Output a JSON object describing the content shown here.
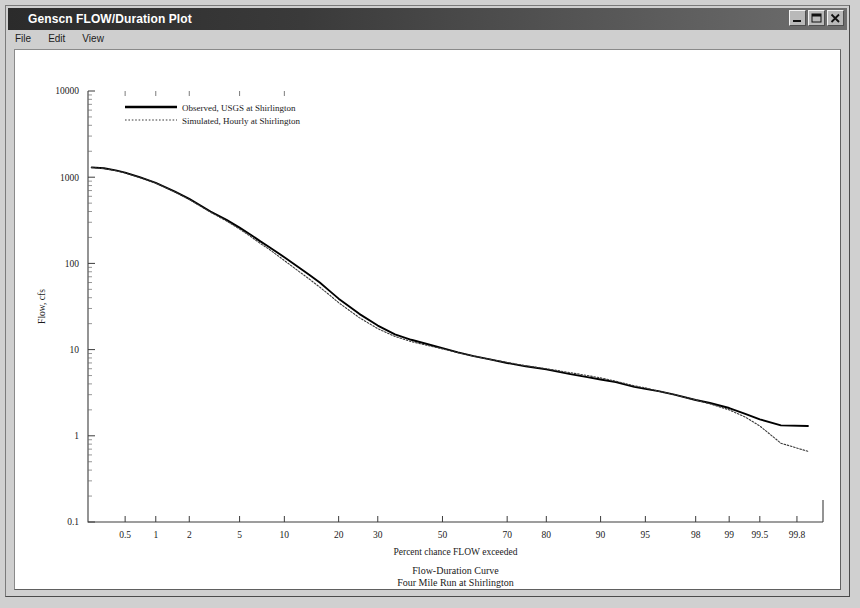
{
  "window": {
    "title": "Genscn FLOW/Duration Plot",
    "buttons": [
      {
        "name": "minimize-button",
        "glyph": "minimize"
      },
      {
        "name": "maximize-button",
        "glyph": "maximize"
      },
      {
        "name": "close-button",
        "glyph": "close"
      }
    ]
  },
  "menu": {
    "items": [
      {
        "label": "File",
        "accel": "F"
      },
      {
        "label": "Edit",
        "accel": "E"
      },
      {
        "label": "View",
        "accel": "V"
      }
    ]
  },
  "chart_data": {
    "type": "line",
    "title": "Flow-Duration Curve",
    "subtitle": "Four Mile Run at Shirlington",
    "daterange": "Jan 1, 1999 - May 31, 2001",
    "xlabel": "Percent chance FLOW exceeded",
    "ylabel": "Flow, cfs",
    "xscale": "probability",
    "yscale": "log",
    "ylim": [
      0.1,
      10000
    ],
    "xlim": [
      0.2,
      99.9
    ],
    "grid": false,
    "legend_position": "top-left",
    "ytick_labels": [
      "10000",
      "1000",
      "100",
      "10",
      "1",
      "0.1"
    ],
    "ytick_values": [
      10000,
      1000,
      100,
      10,
      1,
      0.1
    ],
    "xtick_labels": [
      "0.5",
      "1",
      "2",
      "5",
      "10",
      "20",
      "30",
      "50",
      "70",
      "80",
      "90",
      "95",
      "98",
      "99",
      "99.5",
      "99.8"
    ],
    "xtick_values": [
      0.5,
      1,
      2,
      5,
      10,
      20,
      30,
      50,
      70,
      80,
      90,
      95,
      98,
      99,
      99.5,
      99.8
    ],
    "series": [
      {
        "name": "Observed, USGS at Shirlington",
        "style": "solid",
        "color": "#000000",
        "x": [
          0.22,
          0.3,
          0.4,
          0.5,
          0.7,
          1.0,
          1.5,
          2.0,
          3.0,
          4.0,
          5.0,
          6.0,
          7.0,
          8.0,
          10.0,
          12.0,
          14.0,
          16.0,
          18.0,
          20.0,
          25.0,
          30.0,
          35.0,
          40.0,
          45.0,
          50.0,
          55.0,
          60.0,
          65.0,
          70.0,
          75.0,
          80.0,
          85.0,
          88.0,
          90.0,
          92.0,
          94.0,
          95.0,
          96.0,
          97.0,
          98.0,
          98.5,
          99.0,
          99.3,
          99.5,
          99.7,
          99.85
        ],
        "y": [
          1300,
          1270,
          1200,
          1130,
          1000,
          860,
          680,
          560,
          400,
          320,
          260,
          215,
          180,
          155,
          118,
          92,
          74,
          60,
          48,
          39,
          26,
          19.0,
          15.0,
          13.0,
          11.6,
          10.4,
          9.3,
          8.4,
          7.7,
          7.0,
          6.4,
          5.9,
          5.2,
          4.8,
          4.5,
          4.2,
          3.7,
          3.5,
          3.3,
          3.0,
          2.6,
          2.4,
          2.1,
          1.8,
          1.55,
          1.32,
          1.3
        ]
      },
      {
        "name": "Simulated, Hourly at Shirlington",
        "style": "dotted",
        "color": "#3a3a3a",
        "x": [
          0.22,
          0.3,
          0.4,
          0.5,
          0.7,
          1.0,
          1.5,
          2.0,
          3.0,
          4.0,
          5.0,
          6.0,
          7.0,
          8.0,
          10.0,
          12.0,
          14.0,
          16.0,
          18.0,
          20.0,
          25.0,
          30.0,
          35.0,
          40.0,
          45.0,
          50.0,
          55.0,
          60.0,
          65.0,
          70.0,
          75.0,
          80.0,
          85.0,
          88.0,
          90.0,
          92.0,
          94.0,
          95.0,
          96.0,
          97.0,
          98.0,
          98.5,
          99.0,
          99.3,
          99.5,
          99.7,
          99.85
        ],
        "y": [
          1290,
          1260,
          1190,
          1120,
          990,
          855,
          672,
          552,
          392,
          310,
          250,
          205,
          170,
          146,
          108,
          83,
          66,
          53,
          43,
          35,
          23.5,
          17.5,
          14.2,
          12.4,
          11.2,
          10.2,
          9.2,
          8.4,
          7.7,
          7.1,
          6.5,
          6.0,
          5.4,
          5.0,
          4.7,
          4.3,
          3.8,
          3.6,
          3.3,
          3.0,
          2.6,
          2.35,
          2.0,
          1.65,
          1.3,
          0.82,
          0.66
        ]
      }
    ]
  }
}
